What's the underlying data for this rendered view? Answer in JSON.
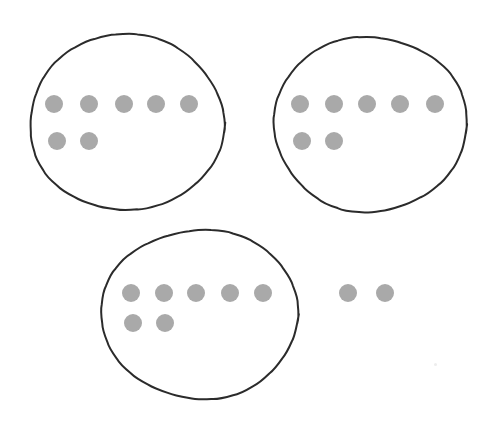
{
  "canvas": {
    "width": 493,
    "height": 421,
    "background_color": "#ffffff",
    "title": "Grouped dots counting worksheet"
  },
  "style": {
    "dot_color": "#a9a9a9",
    "dot_diameter": 18,
    "outline_color": "#2b2b2b",
    "outline_width": 2
  },
  "groups": [
    {
      "name": "group-1",
      "shape": "oval",
      "x": 28,
      "y": 33,
      "width": 197,
      "height": 179,
      "dot_count": 7,
      "rows": [
        {
          "name": "top-row",
          "count": 5,
          "y": 104,
          "x_positions": [
            54,
            89,
            124,
            156,
            189
          ]
        },
        {
          "name": "bottom-row",
          "count": 2,
          "y": 141,
          "x_positions": [
            57,
            89
          ]
        }
      ]
    },
    {
      "name": "group-2",
      "shape": "oval",
      "x": 272,
      "y": 35,
      "width": 196,
      "height": 178,
      "dot_count": 7,
      "rows": [
        {
          "name": "top-row",
          "count": 5,
          "y": 104,
          "x_positions": [
            300,
            334,
            367,
            400,
            435
          ]
        },
        {
          "name": "bottom-row",
          "count": 2,
          "y": 141,
          "x_positions": [
            302,
            334
          ]
        }
      ]
    },
    {
      "name": "group-3",
      "shape": "oval",
      "x": 100,
      "y": 228,
      "width": 200,
      "height": 172,
      "dot_count": 7,
      "rows": [
        {
          "name": "top-row",
          "count": 5,
          "y": 293,
          "x_positions": [
            131,
            164,
            196,
            230,
            263
          ]
        },
        {
          "name": "bottom-row",
          "count": 2,
          "y": 323,
          "x_positions": [
            133,
            165
          ]
        }
      ]
    }
  ],
  "loose_dots": {
    "name": "ungrouped-dots",
    "count": 2,
    "y": 293,
    "x_positions": [
      348,
      385
    ]
  },
  "totals": {
    "groups": 3,
    "dots_per_group": 7,
    "grouped_dots": 21,
    "loose_dots": 2,
    "total_dots": 23
  },
  "artifacts": [
    {
      "name": "scan-speck",
      "x": 434,
      "y": 363,
      "size": 3
    }
  ]
}
